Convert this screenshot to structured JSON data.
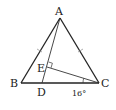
{
  "figure": {
    "type": "triangle-geometry",
    "points": {
      "A": "A",
      "B": "B",
      "C": "C",
      "D": "D",
      "E": "E"
    },
    "angle_label": "16°",
    "segments": [
      "AB",
      "AC",
      "BC",
      "AD",
      "CE"
    ],
    "equal_sides": [
      "AB",
      "AC"
    ],
    "right_angle_at": "E",
    "angle_marked_at": "C (angle ECB)"
  }
}
